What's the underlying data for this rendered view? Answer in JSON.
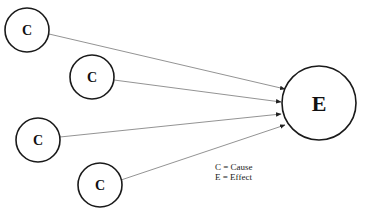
{
  "diagram": {
    "cause_nodes": [
      {
        "label": "C",
        "cx": 27,
        "cy": 30,
        "r": 22
      },
      {
        "label": "C",
        "cx": 92,
        "cy": 77,
        "r": 22
      },
      {
        "label": "C",
        "cx": 38,
        "cy": 140,
        "r": 22
      },
      {
        "label": "C",
        "cx": 100,
        "cy": 185,
        "r": 22
      }
    ],
    "effect_node": {
      "label": "E",
      "cx": 319,
      "cy": 103,
      "r": 37
    },
    "edges": [
      {
        "from": 0,
        "x1": 49,
        "y1": 34,
        "x2": 285,
        "y2": 89
      },
      {
        "from": 1,
        "x1": 114,
        "y1": 80,
        "x2": 281,
        "y2": 102
      },
      {
        "from": 2,
        "x1": 60,
        "y1": 137,
        "x2": 281,
        "y2": 114
      },
      {
        "from": 3,
        "x1": 121,
        "y1": 180,
        "x2": 285,
        "y2": 125
      }
    ],
    "legend": {
      "line1": "C = Cause",
      "line2": "E = Effect"
    },
    "colors": {
      "node_stroke": "#1a1a1a",
      "edge_stroke": "#777777",
      "arrow_fill": "#222222"
    }
  }
}
